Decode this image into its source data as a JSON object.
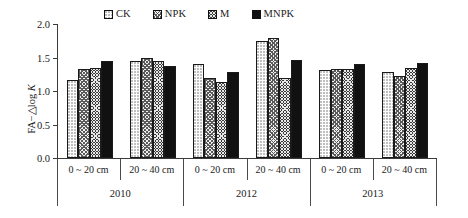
{
  "chart_data": {
    "type": "bar",
    "title": "",
    "xlabel": "",
    "ylabel": "FA−△log K",
    "ylim": [
      0.0,
      2.0
    ],
    "ytick_labels": [
      "0.0",
      "0.5",
      "1.0",
      "1.5",
      "2.0"
    ],
    "ytick_values": [
      0.0,
      0.5,
      1.0,
      1.5,
      2.0
    ],
    "grid": false,
    "legend_position": "top-center",
    "legend": [
      "CK",
      "NPK",
      "M",
      "MNPK"
    ],
    "group_labels": [
      "2010",
      "2012",
      "2013"
    ],
    "categories": [
      "0 ~ 20 cm",
      "20 ~ 40 cm",
      "0 ~ 20 cm",
      "20 ~ 40 cm",
      "0 ~ 20 cm",
      "20 ~ 40 cm"
    ],
    "series": [
      {
        "name": "CK",
        "values": [
          1.17,
          1.45,
          1.4,
          1.75,
          1.32,
          1.28
        ]
      },
      {
        "name": "NPK",
        "values": [
          1.33,
          1.49,
          1.19,
          1.79,
          1.33,
          1.23
        ]
      },
      {
        "name": "M",
        "values": [
          1.35,
          1.45,
          1.14,
          1.2,
          1.33,
          1.35
        ]
      },
      {
        "name": "MNPK",
        "values": [
          1.45,
          1.38,
          1.29,
          1.47,
          1.4,
          1.42
        ]
      }
    ]
  },
  "legend": {
    "items": [
      {
        "label": "CK",
        "pattern": "pat-ck",
        "icon": "legend-swatch-dotted"
      },
      {
        "label": "NPK",
        "pattern": "pat-npk",
        "icon": "legend-swatch-crosshatch"
      },
      {
        "label": "M",
        "pattern": "pat-m",
        "icon": "legend-swatch-dark-crosshatch"
      },
      {
        "label": "MNPK",
        "pattern": "pat-mnpk",
        "icon": "legend-swatch-solid-black"
      }
    ]
  },
  "axis": {
    "y_label": "FA−△log K",
    "y_label_prefix": "FA−△log ",
    "y_label_italic": "K",
    "y_ticks": [
      "2.0",
      "1.5",
      "1.0",
      "0.5",
      "0.0"
    ]
  },
  "depth_labels": [
    "0 ~ 20 cm",
    "20 ~ 40 cm",
    "0 ~ 20 cm",
    "20 ~ 40 cm",
    "0 ~ 20 cm",
    "20 ~ 40 cm"
  ],
  "year_labels": [
    "2010",
    "2012",
    "2013"
  ],
  "colors": {
    "axis": "#3a3a3a",
    "bar_outline": "#1a1a1a",
    "ck_fill": "#fdfdfd",
    "npk_fill": "#f0f0f0",
    "m_fill": "#3a3a3a",
    "mnpk_fill": "#111111",
    "background": "#ffffff"
  }
}
